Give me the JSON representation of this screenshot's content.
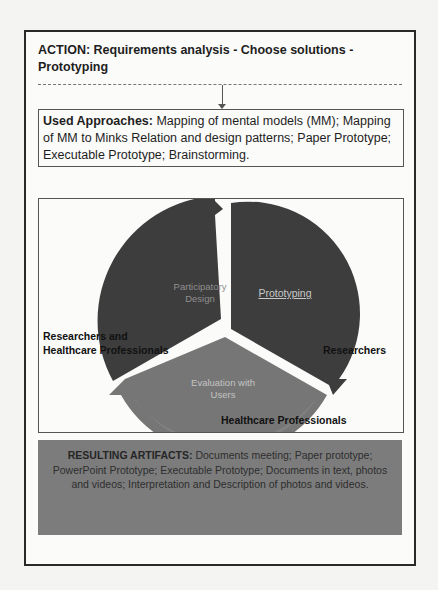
{
  "action": {
    "text": "ACTION: Requirements analysis - Choose solutions - Prototyping"
  },
  "approaches": {
    "label": "Used Approaches:",
    "text": " Mapping of mental models (MM); Mapping of  MM to Minks Relation and design patterns; Paper Prototype; Executable Prototype; Brainstorming."
  },
  "cycle": {
    "segments": [
      {
        "label": "Participatory Design",
        "line1": "Participatory",
        "line2": "Design",
        "color": "#3d3d3d",
        "text_color": "#8f8f8f"
      },
      {
        "label": "Prototyping",
        "color": "#3d3d3d",
        "text_color": "#c8c8c8",
        "underlined": true
      },
      {
        "label": "Evaluation with Users",
        "line1": "Evaluation with",
        "line2": "Users",
        "color": "#767676",
        "text_color": "#c4c4c4"
      }
    ],
    "actors": {
      "left_line1": "Researchers and",
      "left_line2": "Healthcare Professionals",
      "right": "Researchers",
      "bottom": "Healthcare Professionals"
    }
  },
  "artifacts": {
    "label": "RESULTING ARTIFACTS:",
    "text": " Documents meeting; Paper prototype;  PowerPoint Prototype; Executable Prototype; Documents in text, photos and videos; Interpretation and Description of photos and videos.",
    "background": "#7c7c7c"
  }
}
